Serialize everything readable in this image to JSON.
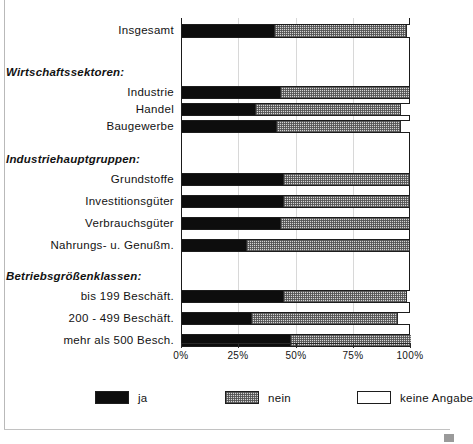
{
  "chart_data": {
    "type": "bar",
    "orientation": "horizontal",
    "stacked": true,
    "title": "",
    "xlabel": "",
    "ylabel": "",
    "xlim": [
      0,
      100
    ],
    "grid": true,
    "legend_position": "bottom",
    "xticks": [
      "0%",
      "25%",
      "50%",
      "75%",
      "100%"
    ],
    "xtick_values": [
      0,
      25,
      50,
      75,
      100
    ],
    "legend": [
      "ja",
      "nein",
      "keine Angabe"
    ],
    "series": [
      {
        "name": "ja",
        "color": "#0d0d0d",
        "values": [
          40,
          43,
          32,
          41,
          44,
          44,
          43,
          28,
          44,
          30,
          47
        ]
      },
      {
        "name": "nein",
        "color": "#d4d4d4",
        "values": [
          58,
          56,
          63,
          54,
          55,
          55,
          56,
          71,
          54,
          64,
          53
        ]
      },
      {
        "name": "keine Angabe",
        "color": "#ffffff",
        "values": [
          2,
          1,
          5,
          5,
          1,
          1,
          1,
          1,
          2,
          6,
          0
        ]
      }
    ],
    "categories": [
      "Insgesamt",
      "Industrie",
      "Handel",
      "Baugewerbe",
      "Grundstoffe",
      "Investitionsgüter",
      "Verbrauchsgüter",
      "Nahrungs- u. Genußm.",
      "bis 199 Beschäft.",
      "200 - 499 Beschäft.",
      "mehr als 500 Besch."
    ],
    "group_headings": [
      "Wirtschaftssektoren:",
      "Industriehauptgruppen:",
      "Betriebsgrößenklassen:"
    ],
    "rows": [
      {
        "label": "Insgesamt",
        "ja": 40,
        "nein": 58,
        "keine": 2,
        "top": 6,
        "height": 14
      },
      {
        "label": "Industrie",
        "ja": 43,
        "nein": 56,
        "keine": 1,
        "top": 68,
        "height": 13
      },
      {
        "label": "Handel",
        "ja": 32,
        "nein": 63,
        "keine": 5,
        "top": 85,
        "height": 13
      },
      {
        "label": "Baugewerbe",
        "ja": 41,
        "nein": 54,
        "keine": 5,
        "top": 102,
        "height": 13
      },
      {
        "label": "Grundstoffe",
        "ja": 44,
        "nein": 55,
        "keine": 1,
        "top": 155,
        "height": 13
      },
      {
        "label": "Investitionsgüter",
        "ja": 44,
        "nein": 55,
        "keine": 1,
        "top": 177,
        "height": 13
      },
      {
        "label": "Verbrauchsgüter",
        "ja": 43,
        "nein": 56,
        "keine": 1,
        "top": 199,
        "height": 13
      },
      {
        "label": "Nahrungs- u. Genußm.",
        "ja": 28,
        "nein": 71,
        "keine": 1,
        "top": 221,
        "height": 13
      },
      {
        "label": "bis 199 Beschäft.",
        "ja": 44,
        "nein": 54,
        "keine": 2,
        "top": 272,
        "height": 13
      },
      {
        "label": "200 - 499 Beschäft.",
        "ja": 30,
        "nein": 64,
        "keine": 6,
        "top": 294,
        "height": 13
      },
      {
        "label": "mehr als 500 Besch.",
        "ja": 47,
        "nein": 53,
        "keine": 0,
        "top": 316,
        "height": 13
      }
    ],
    "headings_layout": [
      {
        "text": "Wirtschaftssektoren:",
        "top": 48
      },
      {
        "text": "Industriehauptgruppen:",
        "top": 135
      },
      {
        "text": "Betriebsgrößenklassen:",
        "top": 252
      }
    ]
  }
}
